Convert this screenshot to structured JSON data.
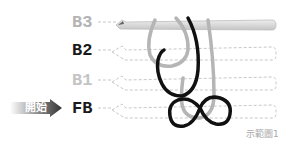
{
  "rows": [
    {
      "label": "B3",
      "color": "#b4b4b4"
    },
    {
      "label": "B2",
      "color": "#1a1a1a"
    },
    {
      "label": "B1",
      "color": "#c4c4c4"
    },
    {
      "label": "FB",
      "color": "#1a1a1a"
    }
  ],
  "start_label": "開始",
  "caption": "示範圖1",
  "colors": {
    "yarn_light": "#b5b5b5",
    "yarn_dark": "#111111",
    "hook": "#cfcfcf",
    "dashed": "#c8c8c8"
  }
}
